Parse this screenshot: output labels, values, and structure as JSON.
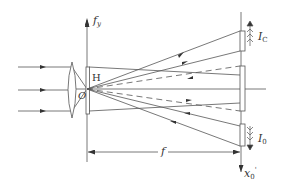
{
  "diagram": {
    "type": "optical-setup",
    "labels": {
      "fy": {
        "main": "f",
        "sub": "y"
      },
      "H": "H",
      "O": "O",
      "Ic": {
        "main": "I",
        "sub": "C"
      },
      "I0": {
        "main": "I",
        "sub": "0"
      },
      "f": "f",
      "x0": {
        "main": "x",
        "sub": "0",
        "sup": "'"
      }
    },
    "colors": {
      "line": "#555555",
      "background": "#ffffff"
    }
  }
}
